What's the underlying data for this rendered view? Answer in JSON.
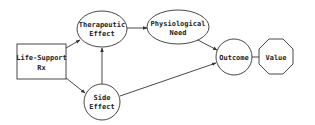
{
  "diagram": {
    "type": "influence-diagram",
    "nodes": {
      "life_support": {
        "line1": "Life-Support",
        "line2": "Rx",
        "shape": "rectangle",
        "kind": "decision"
      },
      "therapeutic_effect": {
        "line1": "Therapeutic",
        "line2": "Effect",
        "shape": "ellipse",
        "kind": "chance"
      },
      "physiological_need": {
        "line1": "Physiological",
        "line2": "Need",
        "shape": "ellipse",
        "kind": "chance"
      },
      "side_effect": {
        "line1": "Side",
        "line2": "Effect",
        "shape": "circle",
        "kind": "chance"
      },
      "outcome": {
        "line1": "Outcome",
        "shape": "circle",
        "kind": "chance"
      },
      "value": {
        "line1": "Value",
        "shape": "octagon",
        "kind": "value"
      }
    },
    "edges": [
      {
        "from": "Life-Support Rx",
        "to": "Therapeutic Effect"
      },
      {
        "from": "Life-Support Rx",
        "to": "Side Effect"
      },
      {
        "from": "Side Effect",
        "to": "Therapeutic Effect"
      },
      {
        "from": "Therapeutic Effect",
        "to": "Physiological Need"
      },
      {
        "from": "Physiological Need",
        "to": "Outcome"
      },
      {
        "from": "Side Effect",
        "to": "Outcome"
      },
      {
        "from": "Outcome",
        "to": "Value"
      }
    ],
    "colors": {
      "stroke": "#333333",
      "fill": "#ffffff",
      "text": "#222222"
    }
  }
}
